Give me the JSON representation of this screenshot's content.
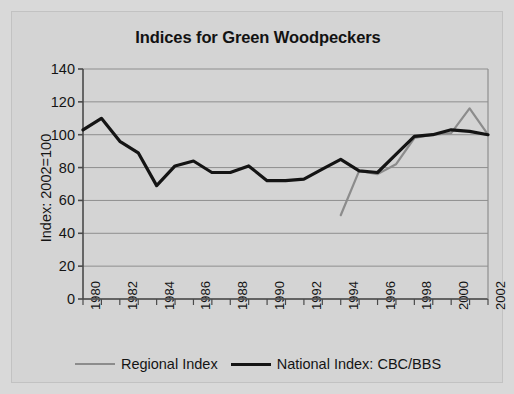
{
  "chart_data": {
    "type": "line",
    "title": "Indices for Green Woodpeckers",
    "xlabel": "",
    "ylabel": "Index: 2002=100",
    "ylim": [
      0,
      140
    ],
    "ytick_step": 20,
    "yticks": [
      140,
      120,
      100,
      80,
      60,
      40,
      20,
      0
    ],
    "xlim": [
      1980,
      2002
    ],
    "x": [
      1980,
      1981,
      1982,
      1983,
      1984,
      1985,
      1986,
      1987,
      1988,
      1989,
      1990,
      1991,
      1992,
      1993,
      1994,
      1995,
      1996,
      1997,
      1998,
      1999,
      2000,
      2001,
      2002
    ],
    "xticks_labeled": [
      "1980",
      "1982",
      "1984",
      "1986",
      "1988",
      "1990",
      "1992",
      "1994",
      "1996",
      "1998",
      "2000",
      "2002"
    ],
    "grid": true,
    "legend_position": "below",
    "series": [
      {
        "name": "National Index: CBC/BBS",
        "color": "#141414",
        "x": [
          1980,
          1981,
          1982,
          1983,
          1984,
          1985,
          1986,
          1987,
          1988,
          1989,
          1990,
          1991,
          1992,
          1993,
          1994,
          1995,
          1996,
          1997,
          1998,
          1999,
          2000,
          2001,
          2002
        ],
        "values": [
          103,
          110,
          96,
          89,
          69,
          81,
          84,
          77,
          77,
          81,
          72,
          72,
          73,
          79,
          85,
          78,
          77,
          88,
          99,
          100,
          103,
          102,
          100
        ]
      },
      {
        "name": "Regional Index",
        "color": "#8c8c8c",
        "x": [
          1994,
          1995,
          1996,
          1997,
          1998,
          1999,
          2000,
          2001,
          2002
        ],
        "values": [
          51,
          78,
          76,
          82,
          98,
          100,
          101,
          116,
          100
        ]
      }
    ]
  },
  "legend": {
    "regional_label": "Regional Index",
    "national_label": "National Index: CBC/BBS"
  }
}
